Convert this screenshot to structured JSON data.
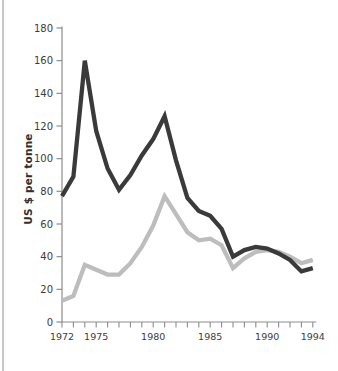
{
  "chart_data": {
    "type": "line",
    "title": "",
    "ylabel": "US $ per tonne",
    "xlabel": "",
    "x": [
      1972,
      1973,
      1974,
      1975,
      1976,
      1977,
      1978,
      1979,
      1980,
      1981,
      1982,
      1983,
      1984,
      1985,
      1986,
      1987,
      1988,
      1989,
      1990,
      1991,
      1992,
      1993,
      1994
    ],
    "series": [
      {
        "name": "dark-line",
        "color": "#3a3a3a",
        "values": [
          77,
          89,
          160,
          117,
          94,
          81,
          90,
          102,
          112,
          126,
          99,
          76,
          68,
          65,
          57,
          40,
          44,
          46,
          45,
          42,
          38,
          31,
          33
        ]
      },
      {
        "name": "light-line",
        "color": "#bdbdbd",
        "values": [
          13,
          16,
          35,
          32,
          29,
          29,
          36,
          46,
          59,
          77,
          66,
          55,
          50,
          51,
          47,
          33,
          39,
          43,
          44,
          43,
          40,
          36,
          38
        ]
      }
    ],
    "ylim": [
      0,
      180
    ],
    "yticks": [
      0,
      20,
      40,
      60,
      80,
      100,
      120,
      140,
      160,
      180
    ],
    "xticks_labeled": [
      1972,
      1975,
      1980,
      1985,
      1990,
      1994
    ],
    "grid": false,
    "legend_position": "none",
    "axis_color": "#8d8d8d",
    "tick_label_color": "#3c3c3c",
    "line_width": 4.3
  }
}
